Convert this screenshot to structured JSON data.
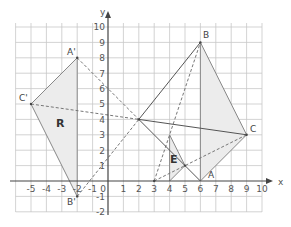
{
  "diagram": {
    "type": "coordinate-grid-transformations",
    "axes": {
      "x_label": "x",
      "y_label": "y",
      "x_ticks": [
        "-5",
        "-4",
        "-3",
        "-2",
        "-1",
        "0",
        "1",
        "2",
        "3",
        "4",
        "5",
        "6",
        "7",
        "8",
        "9",
        "10"
      ],
      "y_ticks": [
        "-2",
        "-1",
        "1",
        "2",
        "3",
        "4",
        "5",
        "6",
        "7",
        "8",
        "9",
        "10"
      ],
      "x_range": [
        -6,
        10
      ],
      "y_range": [
        -2,
        10
      ]
    },
    "shapes": {
      "triangle_ABC": {
        "points": {
          "A": [
            6,
            0
          ],
          "B": [
            6,
            9
          ],
          "C": [
            9,
            3
          ]
        },
        "labels": {
          "A": "A",
          "B": "B",
          "C": "C"
        }
      },
      "triangle_R": {
        "label": "R",
        "points": {
          "A_prime": [
            -2,
            8
          ],
          "B_prime": [
            -2,
            -1
          ],
          "C_prime": [
            -5,
            5
          ]
        },
        "labels": {
          "A_prime": "A'",
          "B_prime": "B'",
          "C_prime": "C'"
        }
      },
      "triangle_E": {
        "label": "E",
        "points": [
          [
            4,
            3
          ],
          [
            4,
            0
          ],
          [
            5,
            1
          ]
        ]
      }
    },
    "centre_of_rotation": [
      2,
      4
    ],
    "centre_of_enlargement": [
      3,
      0
    ],
    "colors": {
      "grid": "#c8c8c8",
      "axis": "#444444",
      "shade": "#ececec",
      "solid_line": "#555555",
      "dashed_line": "#777777"
    }
  }
}
